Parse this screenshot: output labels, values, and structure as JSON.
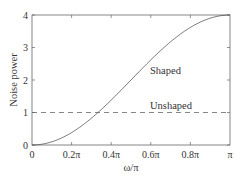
{
  "chart_data": {
    "type": "line",
    "title": "",
    "xlabel": "ω/π",
    "ylabel": "Noise power",
    "xlim": [
      0,
      1
    ],
    "ylim": [
      0,
      4
    ],
    "grid": false,
    "legend": "none (inline annotations)",
    "x_ticks": [
      0,
      0.2,
      0.4,
      0.6,
      0.8,
      1.0
    ],
    "x_tick_labels": [
      "0",
      "0.2π",
      "0.4π",
      "0.6π",
      "0.8π",
      "π"
    ],
    "y_ticks": [
      0,
      1,
      2,
      3,
      4
    ],
    "y_tick_labels": [
      "0",
      "1",
      "2",
      "3",
      "4"
    ],
    "x": [
      0,
      0.1,
      0.2,
      0.3,
      0.333,
      0.4,
      0.5,
      0.6,
      0.7,
      0.8,
      0.9,
      1.0
    ],
    "series": [
      {
        "name": "Shaped",
        "style": "solid",
        "formula": "4 sin^2(ω/2)",
        "values": [
          0,
          0.098,
          0.382,
          0.824,
          1.0,
          1.382,
          2.0,
          2.618,
          3.176,
          3.618,
          3.902,
          4.0
        ]
      },
      {
        "name": "Unshaped",
        "style": "dashed",
        "values": [
          1,
          1,
          1,
          1,
          1,
          1,
          1,
          1,
          1,
          1,
          1,
          1
        ]
      }
    ],
    "annotations": [
      {
        "text": "Shaped",
        "x": 0.6,
        "y": 2.0
      },
      {
        "text": "Unshaped",
        "x": 0.6,
        "y": 1.2
      }
    ]
  },
  "labels": {
    "xlabel": "ω/π",
    "ylabel": "Noise power",
    "shaped": "Shaped",
    "unshaped": "Unshaped",
    "xt0": "0",
    "xt1": "0.2π",
    "xt2": "0.4π",
    "xt3": "0.6π",
    "xt4": "0.8π",
    "xt5": "π",
    "yt0": "0",
    "yt1": "1",
    "yt2": "2",
    "yt3": "3",
    "yt4": "4"
  },
  "colors": {
    "line": "#555555",
    "axes": "#555555"
  }
}
